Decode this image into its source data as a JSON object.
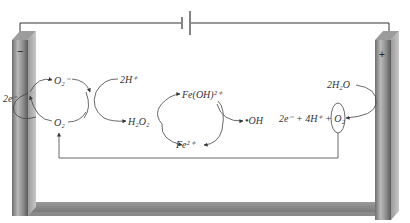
{
  "diagram": {
    "type": "electro-Fenton electrochemical cell",
    "battery": {
      "symbol": "DC power source"
    },
    "cathode": {
      "sign": "−",
      "label": "cathode (negative electrode)"
    },
    "anode": {
      "sign": "+",
      "label": "anode (positive electrode)"
    },
    "cathode_cycle": {
      "electrons": "2e⁻",
      "superoxide": "O₂⁻",
      "oxygen": "O₂",
      "protons": "2H⁺",
      "product": "H₂O₂"
    },
    "fenton_cycle": {
      "ferric_complex": "Fe(OH)²⁺",
      "ferrous": "Fe²⁺",
      "radical": "•OH"
    },
    "anode_reaction": {
      "reactant": "2H₂O",
      "products": "2e⁻ + 4H⁺ + O₂"
    },
    "colors": {
      "electrode": "#8a8a8a",
      "electrode_light": "#b8b8b8",
      "wire": "#333333",
      "arrow": "#444444"
    }
  }
}
